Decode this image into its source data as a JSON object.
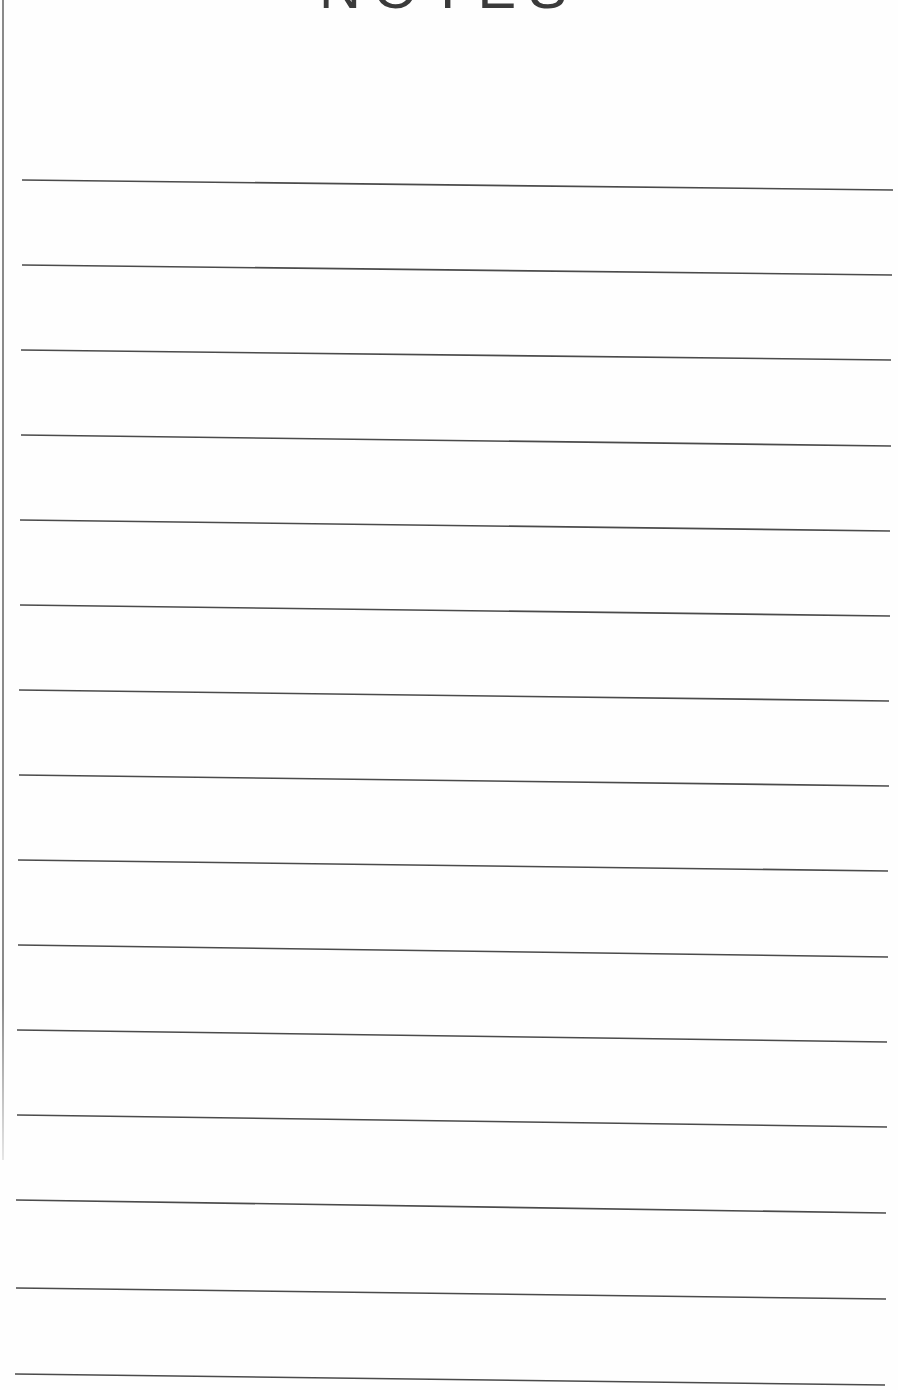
{
  "page": {
    "title": "NOTES",
    "line_count": 15,
    "line_color": "#4a4a4a",
    "rules": [
      {
        "x1": 22,
        "y1": 180,
        "x2": 893,
        "y2": 190
      },
      {
        "x1": 22,
        "y1": 265,
        "x2": 892,
        "y2": 275
      },
      {
        "x1": 21,
        "y1": 350,
        "x2": 891,
        "y2": 360
      },
      {
        "x1": 21,
        "y1": 435,
        "x2": 891,
        "y2": 446
      },
      {
        "x1": 20,
        "y1": 520,
        "x2": 890,
        "y2": 531
      },
      {
        "x1": 20,
        "y1": 605,
        "x2": 890,
        "y2": 616
      },
      {
        "x1": 19,
        "y1": 690,
        "x2": 889,
        "y2": 701
      },
      {
        "x1": 19,
        "y1": 775,
        "x2": 889,
        "y2": 786
      },
      {
        "x1": 18,
        "y1": 860,
        "x2": 888,
        "y2": 871
      },
      {
        "x1": 18,
        "y1": 945,
        "x2": 888,
        "y2": 957
      },
      {
        "x1": 17,
        "y1": 1030,
        "x2": 887,
        "y2": 1042
      },
      {
        "x1": 17,
        "y1": 1115,
        "x2": 887,
        "y2": 1127
      },
      {
        "x1": 16,
        "y1": 1200,
        "x2": 886,
        "y2": 1213
      },
      {
        "x1": 16,
        "y1": 1288,
        "x2": 886,
        "y2": 1299
      },
      {
        "x1": 15,
        "y1": 1374,
        "x2": 885,
        "y2": 1385
      }
    ]
  }
}
